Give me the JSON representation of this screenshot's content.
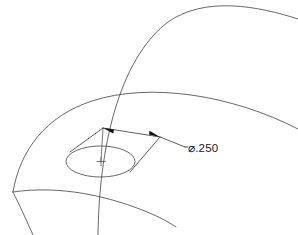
{
  "drawing": {
    "title": "Counterbore hole detail view",
    "background_color": "#ffffff",
    "line_color": "#4a4a4a",
    "dimension_color": "#333333",
    "text_color": "#1a1a1a",
    "dimension": {
      "label": "⌀.250",
      "symbol_name": "diameter-symbol",
      "value": ".250",
      "symbol": "⌀",
      "type": "diameter"
    },
    "features": [
      {
        "name": "outer-boundary-arc",
        "kind": "arc"
      },
      {
        "name": "inner-boundary-arc",
        "kind": "arc"
      },
      {
        "name": "vertical-edge-curve",
        "kind": "arc"
      },
      {
        "name": "bottom-boundary-arc",
        "kind": "arc"
      },
      {
        "name": "hole-ellipse",
        "kind": "ellipse"
      },
      {
        "name": "hole-center-line",
        "kind": "line"
      },
      {
        "name": "hole-center-mark",
        "kind": "cross"
      },
      {
        "name": "diameter-leader",
        "kind": "leader"
      }
    ]
  }
}
